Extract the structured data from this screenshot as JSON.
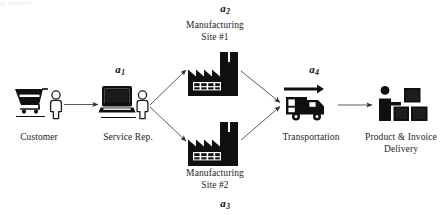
{
  "figure": {
    "type": "process-flow-diagram",
    "background_color": "#ffffff",
    "ink_color": "#101010",
    "arrow_color": "#3d3d3d",
    "cropped_header_text": "an   scenario"
  },
  "nodes": [
    {
      "id": "customer",
      "label": "Customer",
      "icon": "shopping-cart-and-person-icon"
    },
    {
      "id": "service-rep",
      "label": "Service Rep.",
      "icon": "laptop-and-person-icon"
    },
    {
      "id": "manufacturing-site-1",
      "label": "Manufacturing\nSite #1",
      "icon": "factory-icon"
    },
    {
      "id": "manufacturing-site-2",
      "label": "Manufacturing\nSite #2",
      "icon": "factory-icon"
    },
    {
      "id": "transportation",
      "label": "Transportation",
      "icon": "delivery-truck-icon"
    },
    {
      "id": "product-invoice-delivery",
      "label": "Product & Invoice\nDelivery",
      "icon": "person-with-boxes-icon"
    }
  ],
  "arcs": [
    {
      "id": "a1",
      "base": "a",
      "subscript": "1",
      "from": "customer",
      "to": "service-rep"
    },
    {
      "id": "a2",
      "base": "a",
      "subscript": "2",
      "from": "service-rep",
      "to": "manufacturing-site-1"
    },
    {
      "id": "a3",
      "base": "a",
      "subscript": "3",
      "from": "service-rep",
      "to": "manufacturing-site-2"
    },
    {
      "id": "a4",
      "base": "a",
      "subscript": "4",
      "from": "transportation",
      "to": "product-invoice-delivery"
    }
  ]
}
